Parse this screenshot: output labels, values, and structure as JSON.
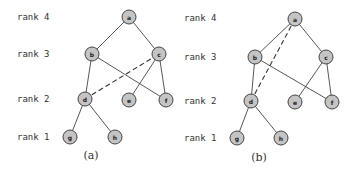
{
  "panels": [
    {
      "caption": "(a)",
      "rank_labels": [
        {
          "text": "rank 4",
          "x": 17,
          "y": 20
        },
        {
          "text": "rank 3",
          "x": 17,
          "y": 57
        },
        {
          "text": "rank 2",
          "x": 17,
          "y": 102
        },
        {
          "text": "rank 1",
          "x": 17,
          "y": 140
        }
      ],
      "caption_pos": {
        "x": 91,
        "y": 159
      },
      "nodes": [
        {
          "id": "a",
          "x": 129,
          "y": 17
        },
        {
          "id": "b",
          "x": 92,
          "y": 54
        },
        {
          "id": "c",
          "x": 159,
          "y": 54
        },
        {
          "id": "d",
          "x": 85,
          "y": 99
        },
        {
          "id": "e",
          "x": 129,
          "y": 100
        },
        {
          "id": "f",
          "x": 166,
          "y": 100
        },
        {
          "id": "g",
          "x": 70,
          "y": 137
        },
        {
          "id": "h",
          "x": 115,
          "y": 137
        }
      ],
      "edges": [
        [
          "a",
          "b"
        ],
        [
          "a",
          "c"
        ],
        [
          "b",
          "d"
        ],
        [
          "b",
          "f"
        ],
        [
          "c",
          "e"
        ],
        [
          "c",
          "f"
        ],
        [
          "d",
          "g"
        ],
        [
          "d",
          "h"
        ]
      ],
      "dashed_edges": [
        [
          "d",
          "c"
        ]
      ]
    },
    {
      "caption": "(b)",
      "rank_labels": [
        {
          "text": "rank 4",
          "x": 184,
          "y": 21
        },
        {
          "text": "rank 3",
          "x": 184,
          "y": 60
        },
        {
          "text": "rank 2",
          "x": 184,
          "y": 104
        },
        {
          "text": "rank 1",
          "x": 184,
          "y": 141
        }
      ],
      "caption_pos": {
        "x": 259,
        "y": 161
      },
      "nodes": [
        {
          "id": "a",
          "x": 295,
          "y": 19
        },
        {
          "id": "b",
          "x": 255,
          "y": 57
        },
        {
          "id": "c",
          "x": 326,
          "y": 57
        },
        {
          "id": "d",
          "x": 251,
          "y": 101
        },
        {
          "id": "e",
          "x": 295,
          "y": 102
        },
        {
          "id": "f",
          "x": 332,
          "y": 102
        },
        {
          "id": "g",
          "x": 237,
          "y": 138
        },
        {
          "id": "h",
          "x": 281,
          "y": 138
        }
      ],
      "edges": [
        [
          "a",
          "b"
        ],
        [
          "a",
          "c"
        ],
        [
          "b",
          "d"
        ],
        [
          "b",
          "f"
        ],
        [
          "c",
          "e"
        ],
        [
          "c",
          "f"
        ],
        [
          "d",
          "g"
        ],
        [
          "d",
          "h"
        ]
      ],
      "dashed_edges": [
        [
          "d",
          "a"
        ]
      ]
    }
  ],
  "style": {
    "node_fill": "#c4c4c4",
    "node_stroke": "#444444",
    "node_radius": 7
  }
}
